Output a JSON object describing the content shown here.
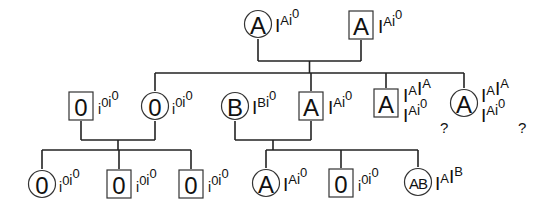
{
  "individuals": [
    {
      "id": "g1-mother",
      "sex": "female",
      "phenotype": "A",
      "genotype": [
        {
          "allele": "I",
          "sup": "A"
        },
        {
          "allele": "i",
          "sup": "0"
        }
      ]
    },
    {
      "id": "g1-father",
      "sex": "male",
      "phenotype": "A",
      "genotype": [
        {
          "allele": "I",
          "sup": "A"
        },
        {
          "allele": "i",
          "sup": "0"
        }
      ]
    },
    {
      "id": "g2-male-o",
      "sex": "male",
      "phenotype": "0",
      "genotype": [
        {
          "allele": "i",
          "sup": "0"
        },
        {
          "allele": "i",
          "sup": "0"
        }
      ]
    },
    {
      "id": "g2-female-o",
      "sex": "female",
      "phenotype": "0",
      "genotype": [
        {
          "allele": "i",
          "sup": "0"
        },
        {
          "allele": "i",
          "sup": "0"
        }
      ]
    },
    {
      "id": "g2-female-b",
      "sex": "female",
      "phenotype": "B",
      "genotype": [
        {
          "allele": "I",
          "sup": "B"
        },
        {
          "allele": "i",
          "sup": "0"
        }
      ]
    },
    {
      "id": "g2-male-a",
      "sex": "male",
      "phenotype": "A",
      "genotype": [
        {
          "allele": "I",
          "sup": "A"
        },
        {
          "allele": "i",
          "sup": "0"
        }
      ]
    },
    {
      "id": "g2-male-a-uncertain",
      "sex": "male",
      "phenotype": "A",
      "genotype_options": [
        [
          {
            "allele": "I",
            "sup": "A"
          },
          {
            "allele": "I",
            "sup": "A"
          }
        ],
        [
          {
            "allele": "I",
            "sup": "A"
          },
          {
            "allele": "i",
            "sup": "0"
          }
        ]
      ],
      "uncertain_mark": "?"
    },
    {
      "id": "g2-female-a-uncertain",
      "sex": "female",
      "phenotype": "A",
      "genotype_options": [
        [
          {
            "allele": "I",
            "sup": "A"
          },
          {
            "allele": "I",
            "sup": "A"
          }
        ],
        [
          {
            "allele": "I",
            "sup": "A"
          },
          {
            "allele": "i",
            "sup": "0"
          }
        ]
      ],
      "uncertain_mark": "?"
    },
    {
      "id": "g3-female-o",
      "sex": "female",
      "phenotype": "0",
      "genotype": [
        {
          "allele": "i",
          "sup": "0"
        },
        {
          "allele": "i",
          "sup": "0"
        }
      ]
    },
    {
      "id": "g3-male-o-1",
      "sex": "male",
      "phenotype": "0",
      "genotype": [
        {
          "allele": "i",
          "sup": "0"
        },
        {
          "allele": "i",
          "sup": "0"
        }
      ]
    },
    {
      "id": "g3-male-o-2",
      "sex": "male",
      "phenotype": "0",
      "genotype": [
        {
          "allele": "i",
          "sup": "0"
        },
        {
          "allele": "i",
          "sup": "0"
        }
      ]
    },
    {
      "id": "g3-female-a",
      "sex": "female",
      "phenotype": "A",
      "genotype": [
        {
          "allele": "I",
          "sup": "A"
        },
        {
          "allele": "i",
          "sup": "0"
        }
      ]
    },
    {
      "id": "g3-male-o-3",
      "sex": "male",
      "phenotype": "0",
      "genotype": [
        {
          "allele": "i",
          "sup": "0"
        },
        {
          "allele": "i",
          "sup": "0"
        }
      ]
    },
    {
      "id": "g3-female-ab",
      "sex": "female",
      "phenotype": "AB",
      "genotype": [
        {
          "allele": "I",
          "sup": "A"
        },
        {
          "allele": "I",
          "sup": "B"
        }
      ]
    }
  ],
  "matings": [
    {
      "parents": [
        "g1-mother",
        "g1-father"
      ],
      "children": [
        "g2-female-o",
        "g2-male-a",
        "g2-male-a-uncertain",
        "g2-female-a-uncertain"
      ]
    },
    {
      "parents": [
        "g2-male-o",
        "g2-female-o"
      ],
      "children": [
        "g3-female-o",
        "g3-male-o-1",
        "g3-male-o-2"
      ]
    },
    {
      "parents": [
        "g2-female-b",
        "g2-male-a"
      ],
      "children": [
        "g3-female-a",
        "g3-male-o-3",
        "g3-female-ab"
      ]
    }
  ]
}
